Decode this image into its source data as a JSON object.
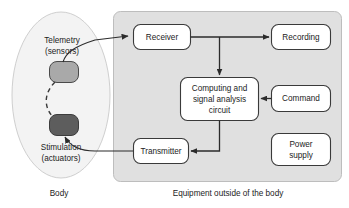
{
  "diagram": {
    "colors": {
      "panel_fill": "#e0e0e0",
      "panel_stroke": "#b5b5b5",
      "body_fill": "#f2f2f2",
      "body_stroke": "#c9c9c9",
      "box_fill": "#ffffff",
      "box_stroke": "#3a3a3a",
      "sensor_fill": "#a8a8a8",
      "actuator_fill": "#5a5a5a",
      "line": "#2b2b2b",
      "text": "#1c1c1c"
    },
    "body_region": {
      "caption": "Body",
      "implants": [
        {
          "name": "sensor-implant",
          "label": "Telemetry\n(sensors)",
          "label_line1": "Telemetry",
          "label_line2": "(sensors)",
          "shade": "light"
        },
        {
          "name": "actuator-implant",
          "label": "Stimulation\n(actuators)",
          "label_line1": "Stimulation",
          "label_line2": "(actuators)",
          "shade": "dark"
        }
      ]
    },
    "equipment_region": {
      "caption": "Equipment outside of the body",
      "nodes": [
        {
          "id": "receiver",
          "label": "Receiver",
          "lines": [
            "Receiver"
          ]
        },
        {
          "id": "recording",
          "label": "Recording",
          "lines": [
            "Recording"
          ]
        },
        {
          "id": "computing",
          "label": "Computing and signal analysis circuit",
          "lines": [
            "Computing and",
            "signal analysis",
            "circuit"
          ]
        },
        {
          "id": "command",
          "label": "Command",
          "lines": [
            "Command"
          ]
        },
        {
          "id": "power-supply",
          "label": "Power supply",
          "lines": [
            "Power",
            "supply"
          ]
        },
        {
          "id": "transmitter",
          "label": "Transmitter",
          "lines": [
            "Transmitter"
          ]
        }
      ]
    },
    "connections": [
      {
        "from": "sensor-implant",
        "to": "receiver",
        "style": "solid-arrow"
      },
      {
        "from": "receiver",
        "to": "recording",
        "style": "solid-arrow"
      },
      {
        "from": "receiver",
        "to": "computing",
        "style": "solid-arrow"
      },
      {
        "from": "command",
        "to": "computing",
        "style": "solid-arrow"
      },
      {
        "from": "computing",
        "to": "transmitter",
        "style": "solid-arrow"
      },
      {
        "from": "transmitter",
        "to": "actuator-implant",
        "style": "solid-arrow"
      },
      {
        "from": "sensor-implant",
        "to": "actuator-implant",
        "style": "dashed"
      }
    ]
  }
}
